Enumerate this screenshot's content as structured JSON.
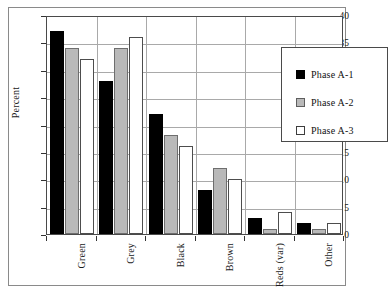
{
  "chart_data": {
    "type": "bar",
    "title": "",
    "subtitle": "",
    "xlabel": "",
    "ylabel": "Percent",
    "categories": [
      "Green",
      "Grey",
      "Black",
      "Brown",
      "Reds (var)",
      "Other"
    ],
    "series": [
      {
        "name": "Phase A-1",
        "color": "#000000",
        "values": [
          37,
          28,
          22,
          8,
          3,
          2
        ]
      },
      {
        "name": "Phase A-2",
        "color": "#b9b9b9",
        "values": [
          34,
          34,
          18,
          12,
          1,
          1
        ]
      },
      {
        "name": "Phase A-3",
        "color": "#ffffff",
        "values": [
          32,
          36,
          16,
          10,
          4,
          2
        ]
      }
    ],
    "ylim": [
      0,
      40
    ],
    "yticks": [
      0,
      5,
      10,
      15,
      20,
      25,
      30,
      35,
      40
    ],
    "ytick_labels": [
      "0",
      "5",
      "10",
      "15",
      "20",
      "25",
      "30",
      "35",
      "40"
    ],
    "grid": true,
    "grid_axis": "both",
    "legend_position": "upper-right-inside",
    "legend_entries": [
      "Phase A-1",
      "Phase A-2",
      "Phase A-3"
    ],
    "annotations": []
  },
  "figure": {
    "frame_color": "#8a8a8a",
    "axis_color": "#4a4a4a",
    "grid_color": "#a9a9a9",
    "background": "#ffffff"
  }
}
